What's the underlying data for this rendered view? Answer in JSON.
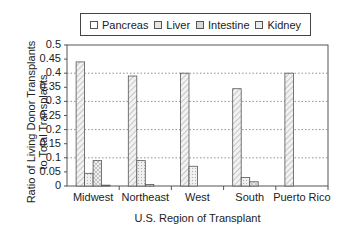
{
  "chart_data": {
    "type": "bar",
    "title": "",
    "xlabel": "U.S. Region of Transplant",
    "ylabel": "Ratio of Living Donor Transplants to Total Transplants",
    "ylabel_lines": [
      "Ratio of Living Donor Transplants",
      "to Total Transplants"
    ],
    "categories": [
      "Midwest",
      "Northeast",
      "West",
      "South",
      "Puerto Rico"
    ],
    "series": [
      {
        "name": "Pancreas",
        "values": [
          0.44,
          0.39,
          0.4,
          0.345,
          0.4
        ]
      },
      {
        "name": "Liver",
        "values": [
          0.045,
          0.09,
          0.07,
          0.03,
          0
        ]
      },
      {
        "name": "Intestine",
        "values": [
          0.09,
          0.005,
          0,
          0.015,
          0
        ]
      },
      {
        "name": "Kidney",
        "values": [
          0.003,
          0,
          0,
          0,
          0
        ]
      }
    ],
    "ylim": [
      0,
      0.5
    ],
    "yticks": [
      "0",
      "0.05",
      "0.1",
      "0.15",
      "0.2",
      "0.25",
      "0.3",
      "0.35",
      "0.4",
      "0.45",
      "0.5"
    ],
    "grid": "horizontal dotted at 0.1 intervals",
    "legend_position": "top"
  },
  "legend": {
    "items": [
      {
        "label": "Pancreas"
      },
      {
        "label": "Liver"
      },
      {
        "label": "Intestine"
      },
      {
        "label": "Kidney"
      }
    ]
  }
}
